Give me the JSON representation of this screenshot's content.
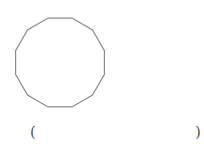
{
  "figure": {
    "shape": "regular dodecagon",
    "sides": 12,
    "stroke_color": "#8a8a8a",
    "fill_color": "#ffffff",
    "center": [
      60,
      62.5
    ],
    "radius": 46,
    "start_angle_deg": -75
  },
  "answer_blank": {
    "open": "(",
    "close": ")"
  }
}
